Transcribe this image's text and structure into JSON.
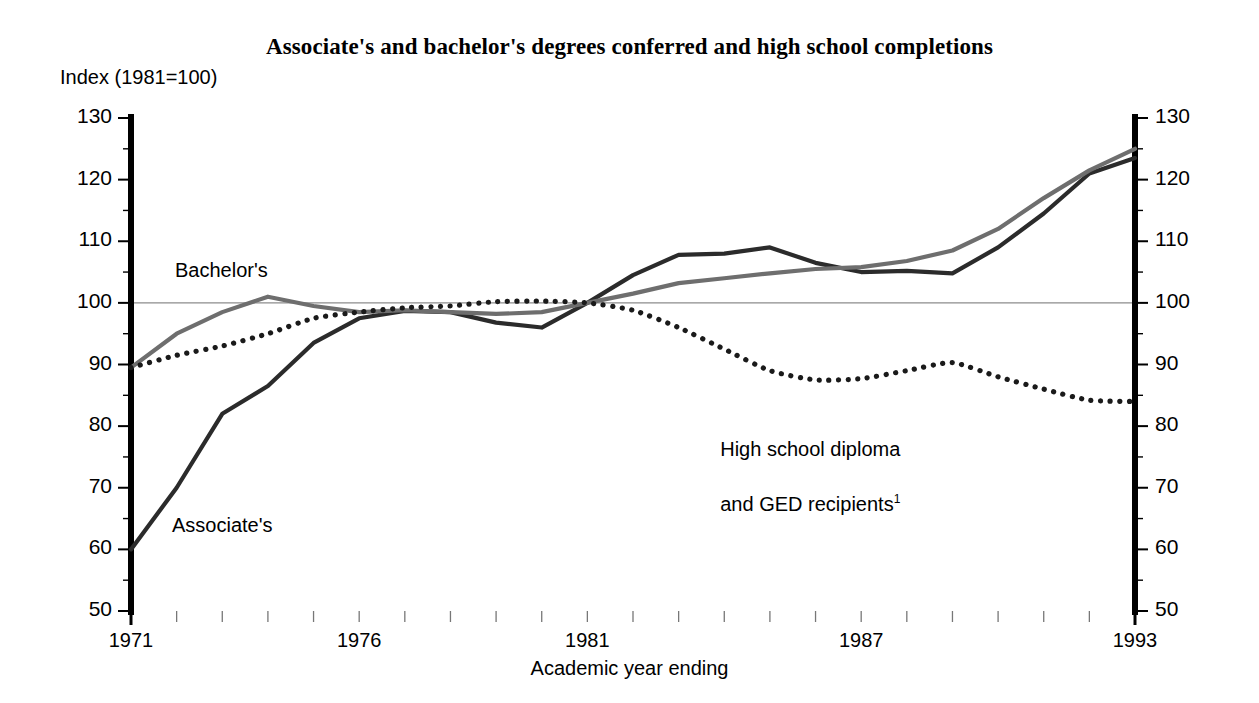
{
  "figure": {
    "title": "Associate's and bachelor's degrees conferred and high school completions",
    "index_label": "Index (1981=100)",
    "xaxis_title": "Academic year ending"
  },
  "labels": {
    "bachelors": "Bachelor's",
    "associates": "Associate's",
    "highschool_line1": "High school diploma",
    "highschool_line2": "and GED recipients",
    "highschool_footnote": "1"
  },
  "colors": {
    "associates": "#2b2b2b",
    "bachelors": "#6e6e6e",
    "highschool": "#1a1a1a",
    "axis": "#000000",
    "reference_line": "#8c8c8c",
    "background": "#ffffff"
  },
  "axes": {
    "y_ticks": [
      50,
      60,
      70,
      80,
      90,
      100,
      110,
      120,
      130
    ],
    "y_minor_step": 5,
    "y_min": 50,
    "y_max": 130,
    "x_min": 1971,
    "x_max": 1993,
    "x_ticks_labeled": [
      1971,
      1976,
      1981,
      1987,
      1993
    ],
    "reference_value": 100
  },
  "chart_data": {
    "type": "line",
    "title": "Associate's and bachelor's degrees conferred and high school completions",
    "subtitle": "Index (1981=100)",
    "xlabel": "Academic year ending",
    "ylabel": "Index (1981=100)",
    "xlim": [
      1971,
      1993
    ],
    "ylim": [
      50,
      130
    ],
    "grid": false,
    "legend": "inline-annotations",
    "reference_line": 100,
    "x": [
      1971,
      1972,
      1973,
      1974,
      1975,
      1976,
      1977,
      1978,
      1979,
      1980,
      1981,
      1982,
      1983,
      1984,
      1985,
      1986,
      1987,
      1988,
      1989,
      1990,
      1991,
      1992,
      1993
    ],
    "series": [
      {
        "name": "Associate's",
        "style": "solid",
        "color": "#2b2b2b",
        "values": [
          60.0,
          70.0,
          82.0,
          86.5,
          93.5,
          97.5,
          98.7,
          98.5,
          96.8,
          96.0,
          100.0,
          104.5,
          107.8,
          108.0,
          109.0,
          106.5,
          105.0,
          105.2,
          104.8,
          109.0,
          114.5,
          121.0,
          123.5
        ]
      },
      {
        "name": "Bachelor's",
        "style": "solid",
        "color": "#6e6e6e",
        "values": [
          89.5,
          95.0,
          98.5,
          101.0,
          99.5,
          98.5,
          98.8,
          98.5,
          98.2,
          98.5,
          100.0,
          101.5,
          103.2,
          104.0,
          104.8,
          105.5,
          105.8,
          106.8,
          108.5,
          112.0,
          117.0,
          121.5,
          125.0
        ]
      },
      {
        "name": "High school diploma and GED recipients",
        "style": "dotted",
        "color": "#1a1a1a",
        "values": [
          89.5,
          91.5,
          93.0,
          95.0,
          97.5,
          98.5,
          99.2,
          99.5,
          100.2,
          100.3,
          100.0,
          98.8,
          96.0,
          92.5,
          89.0,
          87.5,
          87.7,
          89.0,
          90.3,
          88.0,
          86.0,
          84.2,
          84.0
        ]
      }
    ]
  }
}
